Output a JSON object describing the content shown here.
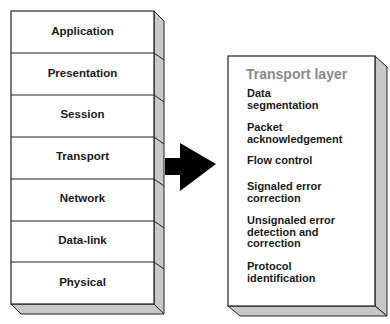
{
  "osi_stack": {
    "layers": [
      {
        "label": "Application"
      },
      {
        "label": "Presentation"
      },
      {
        "label": "Session"
      },
      {
        "label": "Transport"
      },
      {
        "label": "Network"
      },
      {
        "label": "Data-link"
      },
      {
        "label": "Physical"
      }
    ]
  },
  "arrow": {
    "direction": "right",
    "color": "#000000"
  },
  "transport_panel": {
    "title": "Transport layer",
    "items": [
      {
        "line1": "Data",
        "line2": "segmentation",
        "line3": ""
      },
      {
        "line1": "Packet",
        "line2": "acknowledgement",
        "line3": ""
      },
      {
        "line1": "Flow control",
        "line2": "",
        "line3": ""
      },
      {
        "line1": "Signaled error",
        "line2": "correction",
        "line3": ""
      },
      {
        "line1": "Unsignaled error",
        "line2": "detection and",
        "line3": "correction"
      },
      {
        "line1": "Protocol",
        "line2": "identification",
        "line3": ""
      }
    ]
  },
  "colors": {
    "side_shade": "#c8c8c8",
    "outline": "#222222",
    "title_gray": "#8a8a8a"
  }
}
